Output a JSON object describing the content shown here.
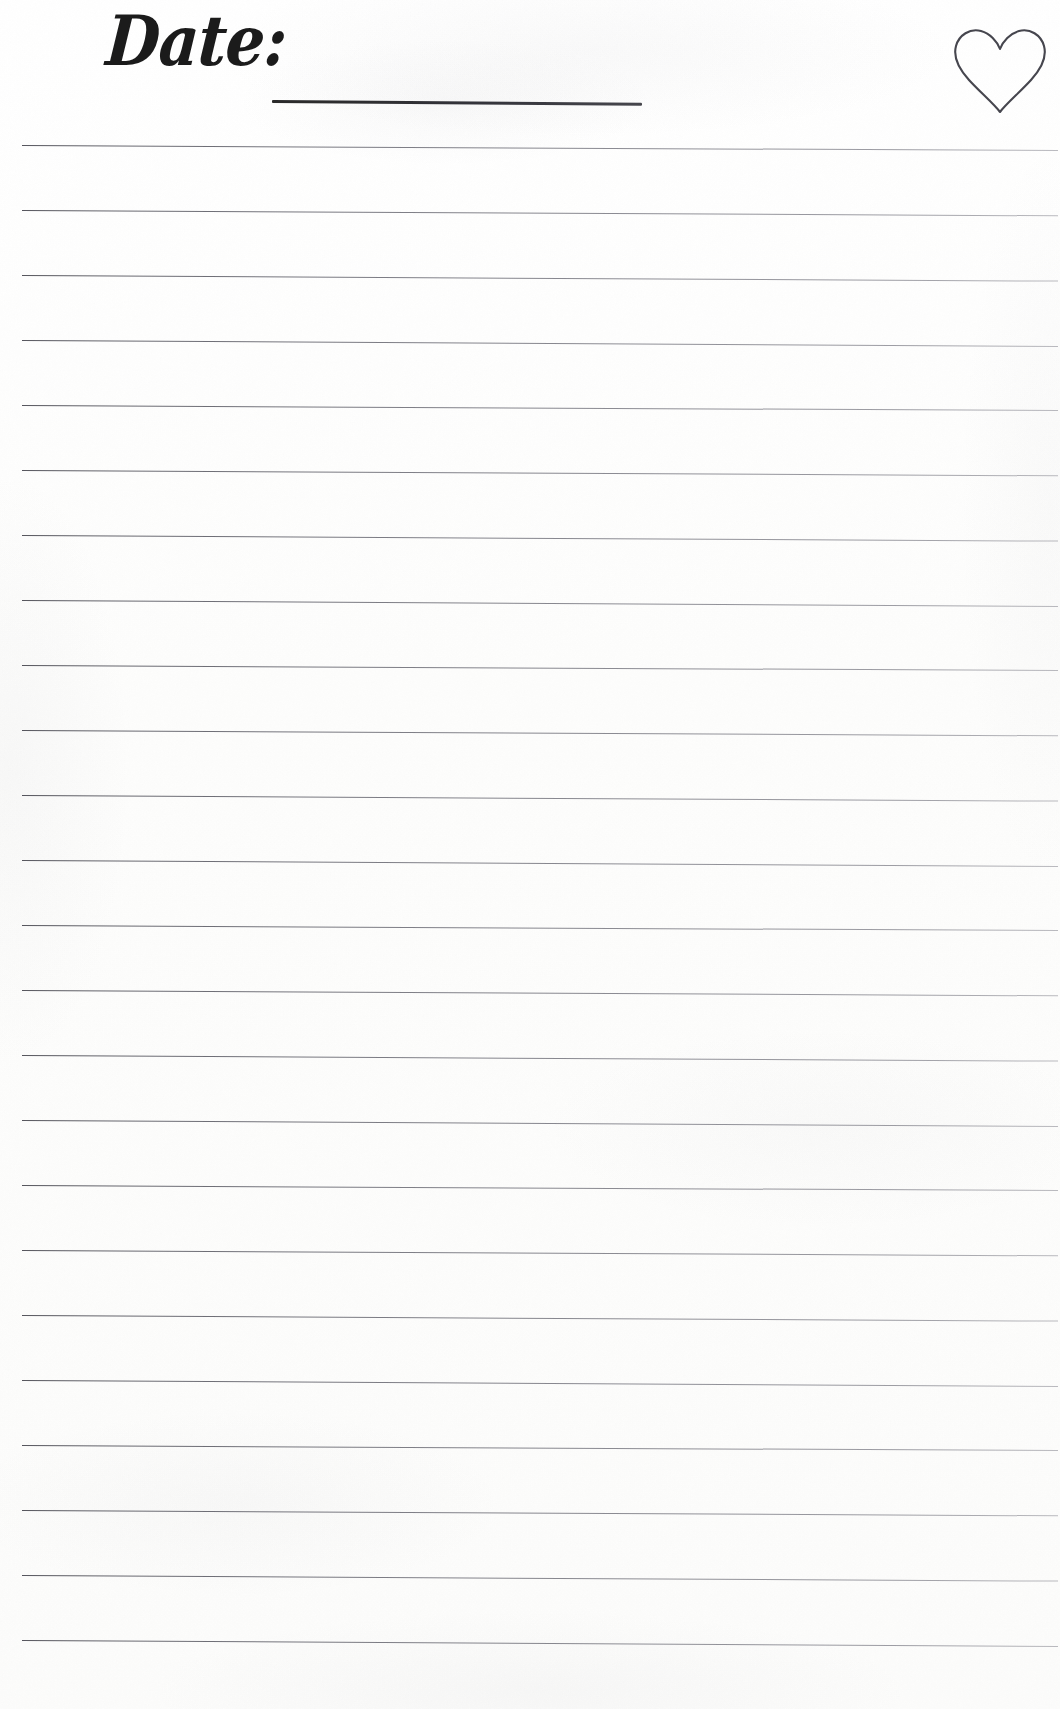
{
  "page": {
    "kind": "lined-journal-page",
    "width": 1060,
    "height": 1709,
    "background_color": "#fdfdfd",
    "ink_color": "#3a3a42"
  },
  "header": {
    "date_label": "Date:",
    "date_field_value": "",
    "date_field_placeholder": "",
    "heart_icon_name": "heart-icon"
  },
  "body": {
    "line_count": 24,
    "line_spacing_px": 65,
    "first_line_y": 145,
    "line_left_x": 22,
    "line_width": 1036,
    "line_slope_deg": 0.3,
    "line_values": [
      "",
      "",
      "",
      "",
      "",
      "",
      "",
      "",
      "",
      "",
      "",
      "",
      "",
      "",
      "",
      "",
      "",
      "",
      "",
      "",
      "",
      "",
      "",
      ""
    ]
  }
}
